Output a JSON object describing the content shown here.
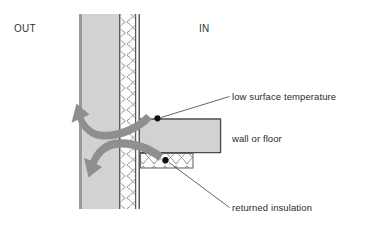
{
  "diagram": {
    "orientation_labels": {
      "outside": "OUT",
      "inside": "IN"
    },
    "annotations": [
      {
        "id": "low-surface-temperature",
        "text": "low surface temperature",
        "marker": "dot",
        "marker_point": [
          157,
          118
        ],
        "leader_from": [
          229,
          97
        ],
        "leader_to": [
          160,
          118
        ]
      },
      {
        "id": "wall-or-floor",
        "text": "wall or floor",
        "marker": "none",
        "leader_from": null,
        "leader_to": null
      },
      {
        "id": "returned-insulation",
        "text": "returned insulation",
        "marker": "dot",
        "marker_point": [
          165,
          160
        ],
        "leader_from": [
          229,
          208
        ],
        "leader_to": [
          168,
          162
        ]
      }
    ],
    "layers": {
      "masonry_fill": "#d2d2d2",
      "insulation_fill": "#fdfdfd",
      "slab_fill": "#d2d2d2",
      "outline": "#4a4a4a",
      "hatch_stroke": "#8c8c8c",
      "arrow_fill": "#8f8f8f",
      "marker_fill": "#111111",
      "leader_stroke": "#4a4a4a"
    },
    "geometry": {
      "wall": {
        "x": 79,
        "y": 14,
        "width": 61,
        "height": 195
      },
      "wall_masonry": {
        "x": 82,
        "y": 14,
        "width": 37,
        "height": 195
      },
      "wall_insulation": {
        "x": 121,
        "y": 14,
        "width": 14,
        "height": 195
      },
      "slab": {
        "x": 140,
        "y": 118,
        "width": 81,
        "height": 35
      },
      "returned_insulation": {
        "x": 140,
        "y": 153,
        "width": 53,
        "height": 15
      }
    },
    "heat_flow_arrows": [
      {
        "id": "upper-heat-flow-arrow",
        "direction": "up-left",
        "head_at": [
          70,
          107
        ]
      },
      {
        "id": "lower-heat-flow-arrow",
        "direction": "down-left",
        "head_at": [
          86,
          170
        ]
      }
    ]
  }
}
